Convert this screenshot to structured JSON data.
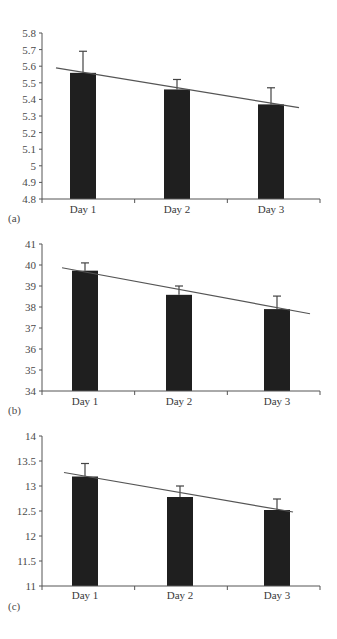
{
  "colors": {
    "bar": "#1f1f1f",
    "axis": "#555555",
    "trend": "#555555",
    "errorbar": "#444444",
    "text": "#4a4a4a"
  },
  "chart_data": [
    {
      "type": "bar",
      "panel_label": "(a)",
      "title": "",
      "xlabel": "",
      "ylabel": "",
      "categories": [
        "Day 1",
        "Day 2",
        "Day 3"
      ],
      "values": [
        5.56,
        5.46,
        5.37
      ],
      "error_upper": [
        5.69,
        5.52,
        5.47
      ],
      "ylim": [
        4.8,
        5.8
      ],
      "yticks": [
        "5.8",
        "5.7",
        "5.6",
        "5.5",
        "5.4",
        "5.3",
        "5.2",
        "5.1",
        "5",
        "4.9",
        "4.8"
      ],
      "trendline": {
        "type": "linear",
        "start": 5.59,
        "end": 5.35
      },
      "grid": false,
      "legend": null
    },
    {
      "type": "bar",
      "panel_label": "(b)",
      "title": "",
      "xlabel": "",
      "ylabel": "",
      "categories": [
        "Day 1",
        "Day 2",
        "Day 3"
      ],
      "values": [
        39.73,
        38.58,
        37.9
      ],
      "error_upper": [
        40.1,
        39.0,
        38.52
      ],
      "ylim": [
        34,
        41
      ],
      "yticks": [
        "41",
        "40",
        "39",
        "38",
        "37",
        "36",
        "35",
        "34"
      ],
      "trendline": {
        "type": "linear",
        "start": 39.87,
        "end": 37.68
      },
      "grid": false,
      "legend": null
    },
    {
      "type": "bar",
      "panel_label": "(c)",
      "title": "",
      "xlabel": "",
      "ylabel": "",
      "categories": [
        "Day 1",
        "Day 2",
        "Day 3"
      ],
      "values": [
        13.19,
        12.78,
        12.52
      ],
      "error_upper": [
        13.45,
        13.0,
        12.74
      ],
      "ylim": [
        11,
        14
      ],
      "yticks": [
        "14",
        "13.5",
        "13",
        "12.5",
        "12",
        "11.5",
        "11"
      ],
      "trendline": {
        "type": "linear",
        "start": 13.27,
        "end": 12.48
      },
      "grid": false,
      "legend": null
    }
  ],
  "layout": [
    {
      "top": 33,
      "bottom": 199,
      "axisX": 42,
      "right": 320,
      "bars": [
        70,
        164,
        258
      ],
      "barW": 26,
      "catX": [
        83,
        177,
        271
      ],
      "catY": 213,
      "panelY": 222,
      "trendX": [
        56,
        299
      ]
    },
    {
      "top": 244,
      "bottom": 391,
      "axisX": 42,
      "right": 320,
      "bars": [
        72,
        166,
        264
      ],
      "barW": 26,
      "catX": [
        85,
        179,
        277
      ],
      "catY": 405,
      "panelY": 414,
      "trendX": [
        62,
        310
      ]
    },
    {
      "top": 436,
      "bottom": 586,
      "axisX": 42,
      "right": 320,
      "bars": [
        72,
        167,
        264
      ],
      "barW": 26,
      "catX": [
        85,
        180,
        277
      ],
      "catY": 599,
      "panelY": 610,
      "trendX": [
        64,
        293
      ]
    }
  ]
}
